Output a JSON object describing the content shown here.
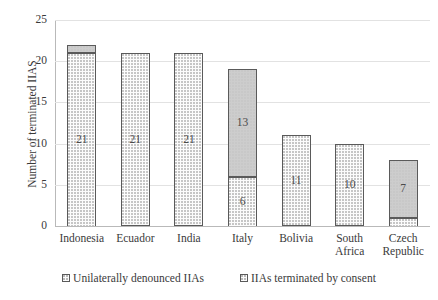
{
  "chart_data": {
    "type": "bar",
    "stacked": true,
    "title": "",
    "xlabel": "",
    "ylabel": "Number of terminated IIAS",
    "ylim": [
      0,
      25
    ],
    "yticks": [
      0,
      5,
      10,
      15,
      20,
      25
    ],
    "grid": true,
    "legend_position": "bottom",
    "categories": [
      "Indonesia",
      "Ecuador",
      "India",
      "Italy",
      "Bolivia",
      "South Africa",
      "Czech Republic"
    ],
    "category_lines": [
      [
        "Indonesia"
      ],
      [
        "Ecuador"
      ],
      [
        "India"
      ],
      [
        "Italy"
      ],
      [
        "Bolivia"
      ],
      [
        "South",
        "Africa"
      ],
      [
        "Czech",
        "Republic"
      ]
    ],
    "series": [
      {
        "name": "Unilaterally denounced IIAs",
        "color": "#fcfcfc",
        "values": [
          21,
          21,
          21,
          6,
          11,
          10,
          1
        ],
        "data_labels": [
          "21",
          "21",
          "21",
          "6",
          "11",
          "10",
          ""
        ]
      },
      {
        "name": "IIAs terminated by consent",
        "color": "#cdcdcd",
        "values": [
          1,
          0,
          0,
          13,
          0,
          0,
          7
        ],
        "data_labels": [
          "",
          "",
          "",
          "13",
          "",
          "",
          "7"
        ]
      }
    ],
    "totals": [
      22,
      21,
      21,
      19,
      11,
      10,
      8
    ]
  },
  "axis": {
    "y_title": "Number of terminated IIAS",
    "y_tick_labels": [
      "0",
      "5",
      "10",
      "15",
      "20",
      "25"
    ]
  },
  "legend": {
    "items": [
      {
        "label": "Unilaterally denounced IIAs"
      },
      {
        "label": "IIAs terminated by consent"
      }
    ]
  },
  "colors": {
    "denounced_fill": "#fcfcfc",
    "consent_fill": "#cdcdcd",
    "bar_outline": "#5a5a5a",
    "gridline": "#e2e2e2",
    "axis": "#b9b9b9",
    "text": "#3a3a3a",
    "background": "#ffffff"
  }
}
